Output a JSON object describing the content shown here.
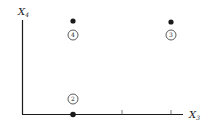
{
  "axes": {
    "y_label": "X",
    "y_label_sub": "4",
    "x_label": "X",
    "x_label_sub": "3"
  },
  "points": [
    {
      "id": "4",
      "x": 1,
      "y": 1,
      "label": "4"
    },
    {
      "id": "3",
      "x": 3,
      "y": 1,
      "label": "3"
    },
    {
      "id": "2",
      "x": 1,
      "y": 0,
      "label": "2"
    }
  ],
  "ticks": [
    1,
    2,
    3
  ],
  "colors": {
    "ink": "#1a1a1a",
    "background": "#ffffff"
  }
}
